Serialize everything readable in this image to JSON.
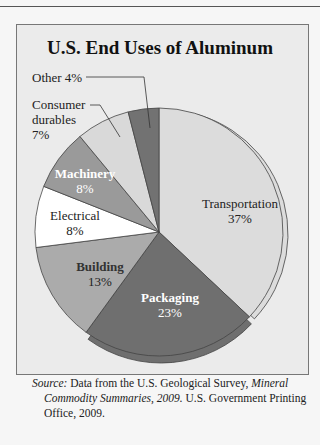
{
  "chart_data": {
    "type": "pie",
    "title": "U.S. End Uses of Aluminum",
    "categories": [
      "Transportation",
      "Packaging",
      "Building",
      "Electrical",
      "Machinery",
      "Consumer durables",
      "Other"
    ],
    "values": [
      37,
      23,
      13,
      8,
      8,
      7,
      4
    ],
    "unit": "%",
    "start_angle": "12 o'clock, clockwise",
    "exploded": [
      "Transportation",
      "Packaging"
    ],
    "colors": {
      "Transportation": "#dcdcdc",
      "Packaging": "#6f6f6f",
      "Building": "#ababab",
      "Electrical": "#ffffff",
      "Machinery": "#9a9a9a",
      "Consumer durables": "#d9d9d9",
      "Other": "#727272"
    }
  },
  "labels": {
    "transportation": {
      "name": "Transportation",
      "pct": "37%"
    },
    "packaging": {
      "name": "Packaging",
      "pct": "23%"
    },
    "building": {
      "name": "Building",
      "pct": "13%"
    },
    "electrical": {
      "name": "Electrical",
      "pct": "8%"
    },
    "machinery": {
      "name": "Machinery",
      "pct": "8%"
    },
    "consumer": {
      "line1": "Consumer",
      "line2": "durables",
      "pct": "7%"
    },
    "other": {
      "text": "Other 4%"
    }
  },
  "source": {
    "label": "Source:",
    "text1": " Data from the U.S. Geological Survey, ",
    "italic": "Mineral Commodity Summaries, 2009.",
    "text2": " U.S. Government Printing Office, 2009."
  }
}
